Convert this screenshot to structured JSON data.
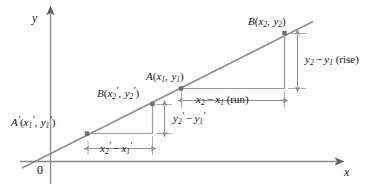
{
  "figure": {
    "kind": "coordinate-plane-slope-similar-triangles",
    "axes": {
      "x_label": "x",
      "y_label": "y",
      "origin_label": "0"
    },
    "points": [
      {
        "id": "A-prime",
        "label_parts": {
          "name": "A",
          "prime": "′",
          "open": "(",
          "x_var": "x",
          "x_sub": "1",
          "x_prime": "′",
          "sep": ", ",
          "y_var": "y",
          "y_sub": "1",
          "y_prime": "′",
          "close": ")"
        },
        "plain": "A′(x₁′, y₁′)",
        "x": 87,
        "y": 133
      },
      {
        "id": "B-prime",
        "label_parts": {
          "name": "B",
          "prime": "",
          "open": "(",
          "x_var": "x",
          "x_sub": "2",
          "x_prime": "′",
          "sep": ", ",
          "y_var": "y",
          "y_sub": "2",
          "y_prime": "′",
          "close": ")"
        },
        "plain": "B(x₂′, y₂′)",
        "x": 152,
        "y": 104
      },
      {
        "id": "A",
        "label_parts": {
          "name": "A",
          "prime": "",
          "open": "(",
          "x_var": "x",
          "x_sub": "1",
          "x_prime": "",
          "sep": ", ",
          "y_var": "y",
          "y_sub": "1",
          "y_prime": "",
          "close": ")"
        },
        "plain": "A(x₁, y₁)",
        "x": 181,
        "y": 88
      },
      {
        "id": "B",
        "label_parts": {
          "name": "B",
          "prime": "",
          "open": "(",
          "x_var": "x",
          "x_sub": "2",
          "x_prime": "",
          "sep": ", ",
          "y_var": "y",
          "y_sub": "2",
          "y_prime": "",
          "close": ")"
        },
        "plain": "B(x₂, y₂)",
        "x": 284,
        "y": 33
      }
    ],
    "measures": [
      {
        "id": "run-small",
        "plain": "x₂′ − x₁′"
      },
      {
        "id": "rise-small",
        "plain": "y₂′ − y₁′"
      },
      {
        "id": "run-large",
        "plain": "x₂ − x₁ (run)",
        "suffix": "(run)"
      },
      {
        "id": "rise-large",
        "plain": "y₂ − y₁ (rise)",
        "suffix": "(rise)"
      }
    ],
    "text": {
      "point_A_prime": {
        "name": "A",
        "p1": "′",
        "lp": "(",
        "xv": "x",
        "xs": "1",
        "xp": "′",
        "comma": ",",
        "yv": "y",
        "ys": "1",
        "yp": "′",
        "rp": ")"
      },
      "point_B_prime": {
        "name": "B",
        "lp": "(",
        "xv": "x",
        "xs": "2",
        "xp": "′",
        "comma": ",",
        "yv": "y",
        "ys": "2",
        "yp": "′",
        "rp": ")"
      },
      "point_A": {
        "name": "A",
        "lp": "(",
        "xv": "x",
        "xs": "1",
        "comma": ",",
        "yv": "y",
        "ys": "1",
        "rp": ")"
      },
      "point_B": {
        "name": "B",
        "lp": "(",
        "xv": "x",
        "xs": "2",
        "comma": ",",
        "yv": "y",
        "ys": "2",
        "rp": ")"
      },
      "run_small": {
        "av": "x",
        "as": "2",
        "ap": "′",
        "minus": "−",
        "bv": "x",
        "bs": "1",
        "bp": "′"
      },
      "rise_small": {
        "av": "y",
        "as": "2",
        "ap": "′",
        "minus": "−",
        "bv": "y",
        "bs": "1",
        "bp": "′"
      },
      "run_large": {
        "av": "x",
        "as": "2",
        "minus": "−",
        "bv": "x",
        "bs": "1",
        "note": "(run)"
      },
      "rise_large": {
        "av": "y",
        "as": "2",
        "minus": "−",
        "bv": "y",
        "bs": "1",
        "note": "(rise)"
      },
      "x_axis": "x",
      "y_axis": "y",
      "origin": "0"
    },
    "colors": {
      "line": "#8a8a8a",
      "axis": "#8a8a8a",
      "leg": "#9a9a9a",
      "dimension": "#9a9a9a",
      "point": "#6e6e6e",
      "text": "#111111",
      "background": "#ffffff"
    }
  }
}
